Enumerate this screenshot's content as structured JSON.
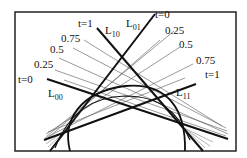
{
  "diagram": {
    "type": "geometric-construction",
    "frame": {
      "x1": 15,
      "y1": 12,
      "x2": 236,
      "y2": 151
    },
    "colors": {
      "ink": "#111111",
      "thin": "#555555",
      "frame": "#222222",
      "background": "#ffffff"
    },
    "thick_lines": [
      {
        "name": "L00",
        "label_main": "L",
        "label_sub": "00",
        "x1": 47,
        "y1": 79,
        "x2": 228,
        "y2": 139,
        "lx": 44,
        "ly": 96
      },
      {
        "name": "L10",
        "label_main": "L",
        "label_sub": "10",
        "x1": 97,
        "y1": 28,
        "x2": 203,
        "y2": 151,
        "lx": 105,
        "ly": 33
      },
      {
        "name": "L01",
        "label_main": "L",
        "label_sub": "01",
        "x1": 155,
        "y1": 14,
        "x2": 50,
        "y2": 151,
        "lx": 125,
        "ly": 26
      },
      {
        "name": "L11",
        "label_main": "L",
        "label_sub": "11",
        "x1": 196,
        "y1": 84,
        "x2": 44,
        "y2": 140,
        "lx": 176,
        "ly": 96
      }
    ],
    "left_family": {
      "label_side": "left",
      "ticks": [
        {
          "t": "t=0",
          "x": 18,
          "y": 83
        },
        {
          "t": "0.25",
          "x": 34,
          "y": 68
        },
        {
          "t": "0.5",
          "x": 50,
          "y": 53
        },
        {
          "t": "0.75",
          "x": 61,
          "y": 42
        },
        {
          "t": "t=1",
          "x": 78,
          "y": 27
        }
      ]
    },
    "right_family": {
      "label_side": "right",
      "ticks": [
        {
          "t": "t=0",
          "x": 155,
          "y": 17
        },
        {
          "t": "0.25",
          "x": 165,
          "y": 34
        },
        {
          "t": "0.5",
          "x": 179,
          "y": 48
        },
        {
          "t": "0.75",
          "x": 196,
          "y": 64
        },
        {
          "t": "t=1",
          "x": 205,
          "y": 77
        }
      ]
    }
  }
}
